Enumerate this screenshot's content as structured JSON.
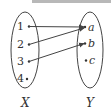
{
  "diagram": {
    "type": "mapping",
    "colors": {
      "stroke": "#444444",
      "text": "#333333",
      "topbar": "#b8b8b8"
    },
    "domain_set": {
      "label": "X",
      "elements": [
        "1",
        "2",
        "3",
        "4"
      ]
    },
    "codomain_set": {
      "label": "Y",
      "elements": [
        "a",
        "b",
        "c"
      ]
    },
    "mappings": [
      {
        "from": "1",
        "to": "a"
      },
      {
        "from": "2",
        "to": "a"
      },
      {
        "from": "3",
        "to": "b"
      }
    ]
  }
}
